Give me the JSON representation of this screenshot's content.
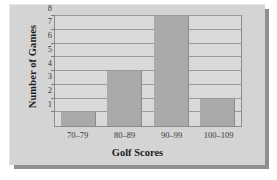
{
  "chart_data": {
    "type": "bar",
    "title": "",
    "xlabel": "Golf Scores",
    "ylabel": "Number of Games",
    "categories": [
      "70–79",
      "80–89",
      "90–99",
      "100–109"
    ],
    "values": [
      1,
      4,
      8,
      2
    ],
    "ytick_labels": [
      "1",
      "2",
      "3",
      "4",
      "5",
      "6",
      "7",
      "8"
    ],
    "ylim": [
      0,
      8
    ],
    "grid": true,
    "legend": "none",
    "colors": {
      "bar_fill": "#a9a9a9",
      "bar_edge": "#8a8a8a",
      "plot_background": "#d9d9d9",
      "gridline": "#9a9a9a",
      "frame": "#8c8c8c",
      "card_background": "#d4d4d4",
      "shadow": "#8f8f8f",
      "text": "#1d1d1d",
      "tick_text": "#3a3a3a"
    }
  }
}
